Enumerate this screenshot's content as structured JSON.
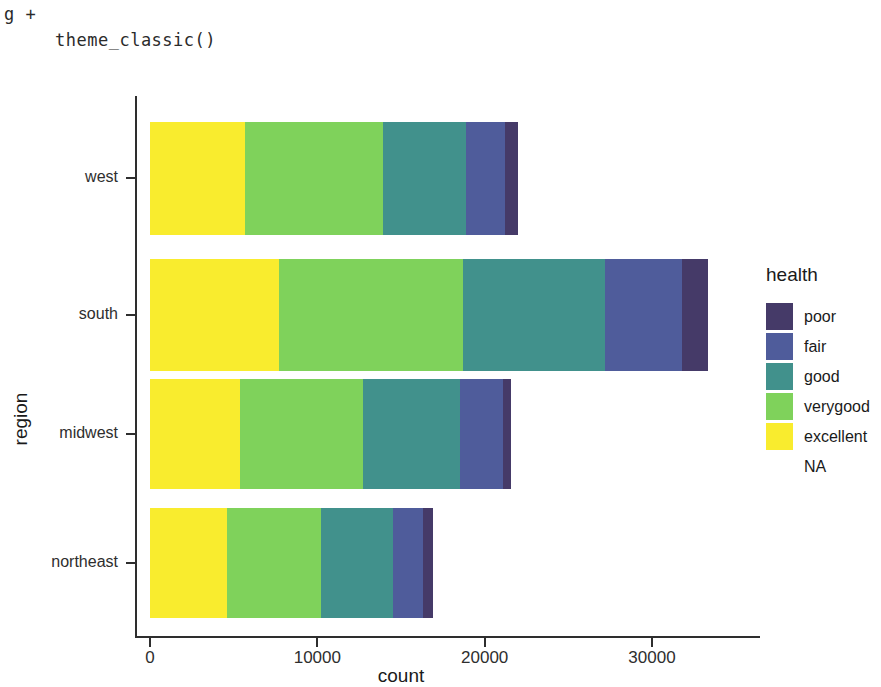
{
  "code": {
    "line1": "g +",
    "line2": "theme_classic()"
  },
  "legend": {
    "title": "health",
    "entries": [
      {
        "label": "poor",
        "color": "#453a68"
      },
      {
        "label": "fair",
        "color": "#4f5c9b"
      },
      {
        "label": "good",
        "color": "#41918c"
      },
      {
        "label": "verygood",
        "color": "#7fd25b"
      },
      {
        "label": "excellent",
        "color": "#f9ec2e"
      },
      {
        "label": "NA",
        "color": "#ffffff"
      }
    ]
  },
  "chart_data": {
    "type": "bar",
    "orientation": "horizontal",
    "stacked": true,
    "title": "",
    "xlabel": "count",
    "ylabel": "region",
    "categories": [
      "west",
      "south",
      "midwest",
      "northeast"
    ],
    "xticks": [
      "0",
      "10000",
      "20000",
      "30000"
    ],
    "xtick_values": [
      0,
      10000,
      20000,
      30000
    ],
    "xlim": [
      0,
      34500
    ],
    "grid": false,
    "legend_position": "right",
    "legend_title": "health",
    "stack_order": [
      "excellent",
      "verygood",
      "good",
      "fair",
      "poor"
    ],
    "series": [
      {
        "name": "excellent",
        "color": "#f9ec2e",
        "values": [
          5700,
          7700,
          5400,
          4600
        ]
      },
      {
        "name": "verygood",
        "color": "#7fd25b",
        "values": [
          8200,
          11000,
          7300,
          5600
        ]
      },
      {
        "name": "good",
        "color": "#41918c",
        "values": [
          5000,
          8500,
          5800,
          4300
        ]
      },
      {
        "name": "fair",
        "color": "#4f5c9b",
        "values": [
          2300,
          4600,
          2600,
          1800
        ]
      },
      {
        "name": "poor",
        "color": "#453a68",
        "values": [
          800,
          1550,
          450,
          600
        ]
      }
    ],
    "totals": [
      22000,
      33350,
      21550,
      16900
    ]
  }
}
